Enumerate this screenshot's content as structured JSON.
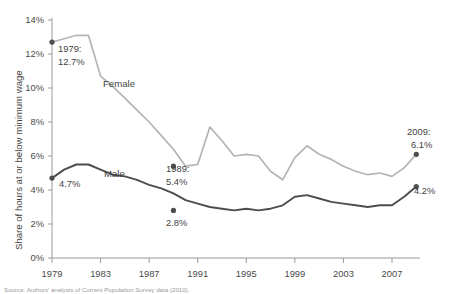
{
  "chart_data": {
    "type": "line",
    "title": "",
    "xlabel": "",
    "ylabel": "Share of hours at or below minimum wage",
    "xlim": [
      1979,
      2009
    ],
    "ylim": [
      0,
      14
    ],
    "grid": false,
    "legend_position": "inline-labels",
    "x": [
      1979,
      1980,
      1981,
      1982,
      1983,
      1984,
      1985,
      1986,
      1987,
      1988,
      1989,
      1990,
      1991,
      1992,
      1993,
      1994,
      1995,
      1996,
      1997,
      1998,
      1999,
      2000,
      2001,
      2002,
      2003,
      2004,
      2005,
      2006,
      2007,
      2008,
      2009
    ],
    "xtick_labels": [
      "1979",
      "1983",
      "1987",
      "1991",
      "1995",
      "1999",
      "2003",
      "2007"
    ],
    "xticks": [
      1979,
      1983,
      1987,
      1991,
      1995,
      1999,
      2003,
      2007
    ],
    "ytick_labels": [
      "0%",
      "2%",
      "4%",
      "6%",
      "8%",
      "10%",
      "12%",
      "14%"
    ],
    "yticks": [
      0,
      2,
      4,
      6,
      8,
      10,
      12,
      14
    ],
    "series": [
      {
        "name": "Female",
        "color": "#b4b4b4",
        "values": [
          12.7,
          12.9,
          13.1,
          13.1,
          10.7,
          10.1,
          9.4,
          8.7,
          8.0,
          7.2,
          6.4,
          5.4,
          5.5,
          7.7,
          6.9,
          6.0,
          6.1,
          6.0,
          5.1,
          4.6,
          5.9,
          6.6,
          6.1,
          5.8,
          5.4,
          5.1,
          4.9,
          5.0,
          4.8,
          5.3,
          6.1
        ]
      },
      {
        "name": "Male",
        "color": "#4d4d4d",
        "values": [
          4.7,
          5.2,
          5.5,
          5.5,
          5.2,
          4.9,
          4.8,
          4.6,
          4.3,
          4.1,
          3.8,
          3.4,
          3.2,
          3.0,
          2.9,
          2.8,
          2.9,
          2.8,
          2.9,
          3.1,
          3.6,
          3.7,
          3.5,
          3.3,
          3.2,
          3.1,
          3.0,
          3.1,
          3.1,
          3.6,
          4.2
        ]
      }
    ],
    "markers": [
      {
        "series": "Female",
        "x": 1979,
        "y": 12.7
      },
      {
        "series": "Female",
        "x": 1989,
        "y": 5.4
      },
      {
        "series": "Female",
        "x": 2009,
        "y": 6.1
      },
      {
        "series": "Male",
        "x": 1979,
        "y": 4.7
      },
      {
        "series": "Male",
        "x": 1989,
        "y": 2.8
      },
      {
        "series": "Male",
        "x": 2009,
        "y": 4.2
      }
    ],
    "annotations": [
      {
        "id": "female-1979",
        "lines": [
          "1979:",
          "12.7%"
        ],
        "x": 1979,
        "y": 12.7
      },
      {
        "id": "male-1979",
        "lines": [
          "4.7%"
        ],
        "x": 1979,
        "y": 4.7
      },
      {
        "id": "female-1989",
        "lines": [
          "1989:",
          "5.4%"
        ],
        "x": 1989,
        "y": 5.4
      },
      {
        "id": "male-1989",
        "lines": [
          "2.8%"
        ],
        "x": 1989,
        "y": 2.8
      },
      {
        "id": "female-2009",
        "lines": [
          "2009:",
          "6.1%"
        ],
        "x": 2009,
        "y": 6.1
      },
      {
        "id": "male-2009",
        "lines": [
          "4.2%"
        ],
        "x": 2009,
        "y": 4.2
      }
    ]
  },
  "axis": {
    "y_title": "Share of hours at or below minimum wage",
    "y_ticks": [
      "14%",
      "12%",
      "10%",
      "8%",
      "6%",
      "4%",
      "2%",
      "0%"
    ],
    "x_ticks": [
      "1979",
      "1983",
      "1987",
      "1991",
      "1995",
      "1999",
      "2003",
      "2007"
    ]
  },
  "series_labels": {
    "female": "Female",
    "male": "Male"
  },
  "annotations": {
    "female_1979_year": "1979:",
    "female_1979_value": "12.7%",
    "male_1979_value": "4.7%",
    "female_1989_year": "1989:",
    "female_1989_value": "5.4%",
    "male_1989_value": "2.8%",
    "female_2009_year": "2009:",
    "female_2009_value": "6.1%",
    "male_2009_value": "4.2%"
  },
  "caption": {
    "text": "Source: Authors' analysis of Current Population Survey data (2010)."
  },
  "colors": {
    "female_line": "#b4b4b4",
    "male_line": "#4d4d4d",
    "axis": "#9a9a9a",
    "text": "#3f3f3f"
  }
}
